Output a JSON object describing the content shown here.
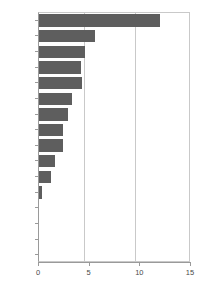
{
  "chart_data": {
    "type": "bar",
    "orientation": "horizontal",
    "title": "",
    "subtitle": "",
    "xlabel": "",
    "ylabel": "",
    "xlim": [
      0,
      15
    ],
    "ylim": null,
    "xticks": [
      "0",
      "5",
      "10",
      "15"
    ],
    "xtick_values": [
      0,
      5,
      10,
      15
    ],
    "grid": "vertical",
    "legend": null,
    "legend_position": "none",
    "bar_color": "#5e5e5e",
    "axis_color": "#9a9a9a",
    "grid_color": "#c9c9c9",
    "text_color": "#4a4a4a",
    "categories": [
      "DK",
      "S",
      "FIN",
      "I",
      "NL",
      "E",
      "D",
      "L",
      "F",
      "A",
      "UK",
      "IRL",
      "B*",
      "P*",
      "EL*",
      "EU-15*"
    ],
    "values": [
      11.9,
      5.5,
      4.5,
      4.1,
      4.2,
      3.3,
      2.9,
      2.4,
      2.4,
      1.6,
      1.2,
      0.3,
      0,
      0,
      0,
      0
    ]
  }
}
